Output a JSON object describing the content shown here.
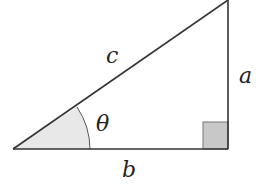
{
  "diagram": {
    "type": "right-triangle",
    "labels": {
      "hypotenuse": "c",
      "opposite": "a",
      "adjacent": "b",
      "angle": "θ"
    },
    "colors": {
      "stroke": "#333333",
      "angle_fill": "#e8e8e8",
      "right_angle_fill": "#c8c8c8",
      "background": "#ffffff"
    }
  }
}
